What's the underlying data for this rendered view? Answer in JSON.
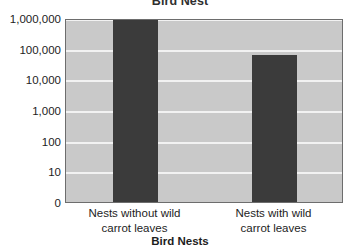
{
  "chart_data": {
    "type": "bar",
    "title": "Bird Nest",
    "xlabel": "Bird Nests",
    "ylabel": "",
    "scale": "log",
    "grid": true,
    "legend": false,
    "categories": [
      "Nests without wild carrot leaves",
      "Nests with wild carrot leaves"
    ],
    "category_lines": [
      [
        "Nests without wild",
        "carrot leaves"
      ],
      [
        "Nests with wild",
        "carrot leaves"
      ]
    ],
    "values": [
      1000000,
      60000
    ],
    "ytick_labels": [
      "1,000,000",
      "100,000",
      "10,000",
      "1,000",
      "100",
      "10",
      "0"
    ],
    "ytick_values": [
      1000000,
      100000,
      10000,
      1000,
      100,
      10,
      0
    ],
    "ylim": [
      0,
      1000000
    ],
    "colors": {
      "bar": "#3b3b3b",
      "plot_background": "#c9c9c9",
      "gridline": "#f2f2f2",
      "plot_border": "#6d6d6d",
      "text": "#1d1d1d",
      "title_text": "#2f2f2f",
      "page_background": "#ffffff"
    }
  }
}
